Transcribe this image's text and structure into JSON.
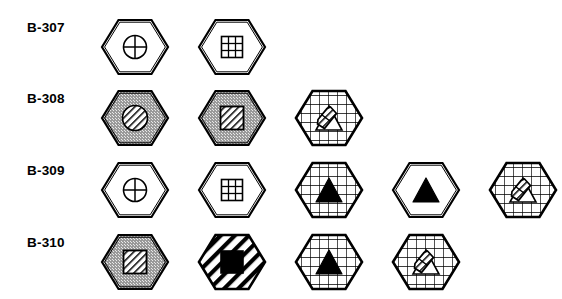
{
  "plate": {
    "width": 554,
    "height": 299,
    "background": "#ffffff",
    "ink": "#000000",
    "gray_fill": "#9a9a9a"
  },
  "rows": [
    {
      "label": "B-307",
      "y": 12,
      "figures": [
        {
          "name": "hexagon-outline-circle-cross",
          "hex_fill": "none",
          "inner": "circle-cross"
        },
        {
          "name": "hexagon-outline-grid-square",
          "hex_fill": "none",
          "inner": "grid-square"
        }
      ]
    },
    {
      "label": "B-308",
      "y": 83,
      "figures": [
        {
          "name": "hexagon-gray-hatched-circle",
          "hex_fill": "gray",
          "inner": "hatched-circle"
        },
        {
          "name": "hexagon-gray-hatched-square",
          "hex_fill": "gray",
          "inner": "hatched-square"
        },
        {
          "name": "hexagon-grid-hatched-arrow",
          "hex_fill": "grid",
          "inner": "hatched-arrow"
        }
      ]
    },
    {
      "label": "B-309",
      "y": 155,
      "figures": [
        {
          "name": "hexagon-outline-circle-cross",
          "hex_fill": "none",
          "inner": "circle-cross"
        },
        {
          "name": "hexagon-outline-grid-square",
          "hex_fill": "none",
          "inner": "grid-square"
        },
        {
          "name": "hexagon-grid-black-triangle",
          "hex_fill": "grid",
          "inner": "black-triangle"
        },
        {
          "name": "hexagon-outline-black-triangle",
          "hex_fill": "none",
          "inner": "black-triangle"
        },
        {
          "name": "hexagon-grid-hatched-arrow",
          "hex_fill": "grid",
          "inner": "hatched-arrow"
        }
      ]
    },
    {
      "label": "B-310",
      "y": 227,
      "figures": [
        {
          "name": "hexagon-gray-hatched-square",
          "hex_fill": "gray",
          "inner": "hatched-square"
        },
        {
          "name": "hexagon-diagonal-stripes-black-square",
          "hex_fill": "stripes",
          "inner": "black-square"
        },
        {
          "name": "hexagon-grid-black-triangle",
          "hex_fill": "grid",
          "inner": "black-triangle"
        },
        {
          "name": "hexagon-grid-hatched-arrow",
          "hex_fill": "grid",
          "inner": "hatched-arrow"
        }
      ]
    }
  ]
}
